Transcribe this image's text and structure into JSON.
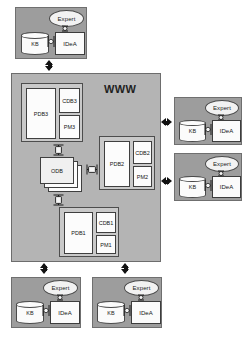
{
  "diagram": {
    "www_label": "WWW",
    "colors": {
      "node_fill": "#9d9d9d",
      "www_fill": "#b4b4b4",
      "group_fill": "#c9c9c9",
      "cell_fill": "#fcfcfc",
      "stroke": "#3f3f3f",
      "arrow_solid": "#111111"
    }
  },
  "labels": {
    "expert": "Expert",
    "kb": "KB",
    "idea": "IDeA",
    "odb": "ODB"
  },
  "agent_nodes": [
    {
      "id": "agent-top",
      "position": "top-left",
      "expert": "Expert",
      "kb": "KB",
      "idea": "IDeA"
    },
    {
      "id": "agent-right-upper",
      "position": "right-upper",
      "expert": "Expert",
      "kb": "KB",
      "idea": "IDeA"
    },
    {
      "id": "agent-right-lower",
      "position": "right-lower",
      "expert": "Expert",
      "kb": "KB",
      "idea": "IDeA"
    },
    {
      "id": "agent-bottom-left",
      "position": "bottom-left",
      "expert": "Expert",
      "kb": "KB",
      "idea": "IDeA"
    },
    {
      "id": "agent-bottom-right",
      "position": "bottom-right",
      "expert": "Expert",
      "kb": "KB",
      "idea": "IDeA"
    }
  ],
  "db_groups": [
    {
      "id": "group-3",
      "pdb": "PDB3",
      "cdb": "CDB3",
      "pm": "PM3"
    },
    {
      "id": "group-2",
      "pdb": "PDB2",
      "cdb": "CDB2",
      "pm": "PM2"
    },
    {
      "id": "group-1",
      "pdb": "PDB1",
      "cdb": "CDB1",
      "pm": "PM1"
    }
  ],
  "odb": {
    "label": "ODB",
    "sheets": 3
  },
  "connectors": [
    {
      "id": "conn-top-www",
      "style": "solid",
      "orientation": "vertical",
      "from": "agent-top",
      "to": "www-box"
    },
    {
      "id": "conn-www-right-up",
      "style": "solid",
      "orientation": "horizontal",
      "from": "www-box",
      "to": "agent-right-upper"
    },
    {
      "id": "conn-www-right-low",
      "style": "solid",
      "orientation": "horizontal",
      "from": "www-box",
      "to": "agent-right-lower"
    },
    {
      "id": "conn-www-bot-left",
      "style": "solid",
      "orientation": "vertical",
      "from": "www-box",
      "to": "agent-bottom-left"
    },
    {
      "id": "conn-www-bot-right",
      "style": "solid",
      "orientation": "vertical",
      "from": "www-box",
      "to": "agent-bottom-right"
    },
    {
      "id": "conn-odb-group3",
      "style": "hollow",
      "orientation": "vertical",
      "from": "odb",
      "to": "group-3"
    },
    {
      "id": "conn-odb-group1",
      "style": "hollow",
      "orientation": "vertical",
      "from": "odb",
      "to": "group-1"
    },
    {
      "id": "conn-odb-group2",
      "style": "hollow",
      "orientation": "horizontal",
      "from": "odb",
      "to": "group-2"
    },
    {
      "id": "conn-expert-idea-1",
      "style": "hollow",
      "orientation": "vertical",
      "from": "agent-top",
      "to": "idea"
    },
    {
      "id": "conn-kb-idea-1",
      "style": "hollow",
      "orientation": "horizontal",
      "from": "kb",
      "to": "idea"
    }
  ]
}
